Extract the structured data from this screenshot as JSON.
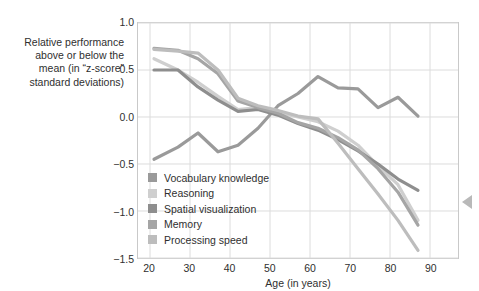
{
  "figure": {
    "y_axis_caption": "Relative performance\nabove or below the\nmean (in “z-score”\nstandard deviations)",
    "x_axis_title": "Age (in years)"
  },
  "legend": {
    "items": [
      {
        "label": "Vocabulary knowledge",
        "color": "#9a9a9a"
      },
      {
        "label": "Reasoning",
        "color": "#cfcfcf"
      },
      {
        "label": "Spatial visualization",
        "color": "#8e8e8e"
      },
      {
        "label": "Memory",
        "color": "#a5a5a5"
      },
      {
        "label": "Processing speed",
        "color": "#bdbdbd"
      }
    ]
  },
  "chart_data": {
    "type": "line",
    "title": "",
    "xlabel": "Age (in years)",
    "ylabel": "Relative performance above or below the mean (in “z-score” standard deviations)",
    "xlim": [
      17,
      97
    ],
    "ylim": [
      -1.5,
      1.0
    ],
    "xticks": [
      20,
      30,
      40,
      50,
      60,
      70,
      80,
      90
    ],
    "yticks": [
      1.0,
      0.5,
      0.0,
      -0.5,
      -1.0,
      -1.5
    ],
    "grid": true,
    "legend_position": "inside-lower-left",
    "series": [
      {
        "name": "Vocabulary knowledge",
        "color": "#9a9a9a",
        "x": [
          21,
          27,
          32,
          37,
          42,
          47,
          52,
          57,
          62,
          67,
          72,
          77,
          82,
          87
        ],
        "y": [
          -0.45,
          -0.32,
          -0.17,
          -0.37,
          -0.3,
          -0.12,
          0.12,
          0.25,
          0.43,
          0.31,
          0.3,
          0.1,
          0.21,
          0.01
        ]
      },
      {
        "name": "Reasoning",
        "color": "#cfcfcf",
        "x": [
          21,
          27,
          32,
          37,
          42,
          47,
          52,
          57,
          62,
          67,
          72,
          77,
          82,
          87
        ],
        "y": [
          0.62,
          0.5,
          0.37,
          0.22,
          0.08,
          0.1,
          0.05,
          0.0,
          -0.05,
          -0.15,
          -0.3,
          -0.52,
          -0.72,
          -1.1
        ]
      },
      {
        "name": "Spatial visualization",
        "color": "#8e8e8e",
        "x": [
          21,
          27,
          32,
          37,
          42,
          47,
          52,
          57,
          62,
          67,
          72,
          77,
          82,
          87
        ],
        "y": [
          0.5,
          0.5,
          0.32,
          0.18,
          0.06,
          0.08,
          0.02,
          -0.07,
          -0.14,
          -0.24,
          -0.36,
          -0.5,
          -0.66,
          -0.78
        ]
      },
      {
        "name": "Memory",
        "color": "#a5a5a5",
        "x": [
          21,
          27,
          32,
          37,
          42,
          47,
          52,
          57,
          62,
          67,
          72,
          77,
          82,
          87
        ],
        "y": [
          0.73,
          0.71,
          0.62,
          0.46,
          0.17,
          0.1,
          0.04,
          -0.06,
          -0.12,
          -0.22,
          -0.35,
          -0.55,
          -0.8,
          -1.15
        ]
      },
      {
        "name": "Processing speed",
        "color": "#bdbdbd",
        "x": [
          21,
          27,
          32,
          37,
          42,
          47,
          52,
          57,
          62,
          67,
          72,
          77,
          82,
          87
        ],
        "y": [
          0.72,
          0.7,
          0.68,
          0.5,
          0.2,
          0.12,
          0.07,
          0.01,
          -0.02,
          -0.28,
          -0.55,
          -0.82,
          -1.1,
          -1.42
        ]
      }
    ]
  }
}
